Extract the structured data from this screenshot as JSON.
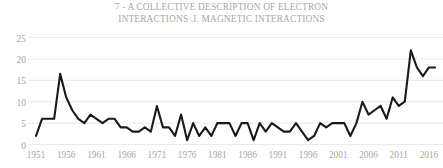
{
  "chart_data": {
    "type": "line",
    "title": "7 - A COLLECTIVE DESCRIPTION OF ELECTRON\nINTERACTIONS .I. MAGNETIC INTERACTIONS",
    "xlabel": "",
    "ylabel": "",
    "xlim": [
      1951,
      2017
    ],
    "ylim": [
      0,
      25
    ],
    "yticks": [
      0,
      5,
      10,
      15,
      20,
      25
    ],
    "xticks": [
      1951,
      1956,
      1961,
      1966,
      1971,
      1976,
      1981,
      1986,
      1991,
      1996,
      2001,
      2006,
      2011,
      2016
    ],
    "grid": "horizontal",
    "legend": "none",
    "line_color": "#1a1a1a",
    "grid_color": "#e9e9e9",
    "tick_label_color": "#a5a5a5",
    "title_color": "#a7a7a7",
    "x": [
      1951,
      1952,
      1953,
      1954,
      1955,
      1956,
      1957,
      1958,
      1959,
      1960,
      1961,
      1962,
      1963,
      1964,
      1965,
      1966,
      1967,
      1968,
      1969,
      1970,
      1971,
      1972,
      1973,
      1974,
      1975,
      1976,
      1977,
      1978,
      1979,
      1980,
      1981,
      1982,
      1983,
      1984,
      1985,
      1986,
      1987,
      1988,
      1989,
      1990,
      1991,
      1992,
      1993,
      1994,
      1995,
      1996,
      1997,
      1998,
      1999,
      2000,
      2001,
      2002,
      2003,
      2004,
      2005,
      2006,
      2007,
      2008,
      2009,
      2010,
      2011,
      2012,
      2013,
      2014,
      2015,
      2016,
      2017
    ],
    "y": [
      2,
      6,
      6,
      6,
      16.5,
      11,
      8,
      6,
      5,
      7,
      6,
      5,
      6,
      6,
      4,
      4,
      3,
      3,
      4,
      3,
      9,
      4,
      4,
      2,
      7,
      1,
      5,
      2,
      4,
      2,
      5,
      5,
      5,
      2,
      5,
      5,
      1,
      5,
      3,
      5,
      4,
      3,
      3,
      5,
      3,
      1,
      2,
      5,
      4,
      5,
      5,
      5,
      2,
      5,
      10,
      7,
      8,
      9,
      6,
      11,
      9,
      10,
      22,
      18,
      16,
      18,
      18
    ],
    "values_note": "Publication counts per year"
  },
  "axis": {
    "y_ticks": [
      "0",
      "5",
      "10",
      "15",
      "20",
      "25"
    ],
    "x_ticks": [
      "1951",
      "1956",
      "1961",
      "1966",
      "1971",
      "1976",
      "1981",
      "1986",
      "1991",
      "1996",
      "2001",
      "2006",
      "2011",
      "2016"
    ]
  }
}
